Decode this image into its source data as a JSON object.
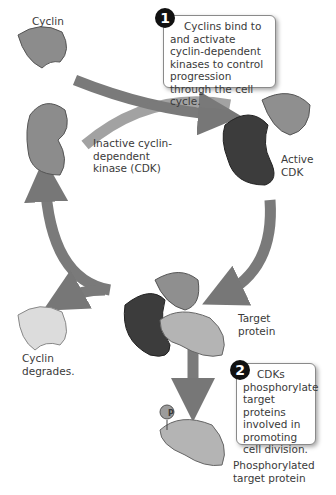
{
  "labels": {
    "cyclin": "Cyclin",
    "inactive_cdk": "Inactive cyclin-\ndependent\nkinase (CDK)",
    "active_cdk": "Active\nCDK",
    "target_protein": "Target\nprotein",
    "cyclin_degrades": "Cyclin\ndegrades.",
    "phosphorylated": "Phosphorylated\ntarget protein",
    "phosphate": "P"
  },
  "steps": [
    {
      "number": "1",
      "text": "Cyclins bind to and activate cyclin-dependent kinases to control progression through the cell cycle."
    },
    {
      "number": "2",
      "text": "CDKs phosphorylate target proteins involved in promoting cell division."
    }
  ],
  "colors": {
    "cyclin": "#8c8c8c",
    "cdk_inactive": "#8c8c8c",
    "cdk_active": "#3c3c3c",
    "target": "#b4b4b4",
    "degraded": "#dcdcdc",
    "arrow": "#777777"
  }
}
